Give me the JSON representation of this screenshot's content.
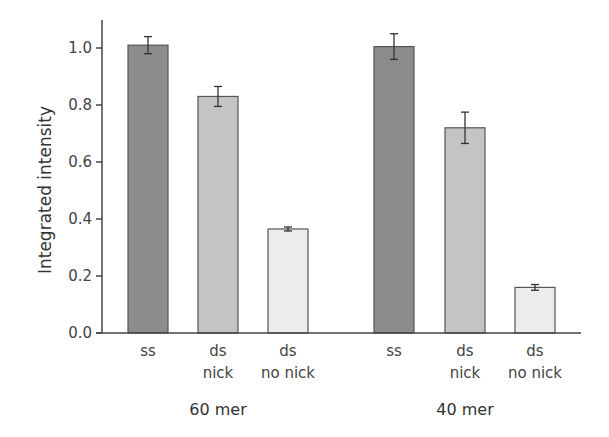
{
  "chart_data": {
    "type": "bar",
    "title": "",
    "xlabel": "",
    "ylabel": "Integrated intensity",
    "ylim": [
      0,
      1.1
    ],
    "yticks": [
      0.0,
      0.2,
      0.4,
      0.6,
      0.8,
      1.0
    ],
    "ytick_labels": [
      "0.0",
      "0.2",
      "0.4",
      "0.6",
      "0.8",
      "1.0"
    ],
    "grid": false,
    "legend": null,
    "groups": [
      {
        "label": "60 mer",
        "bars": [
          {
            "category": "ss",
            "category_lines": [
              "ss"
            ],
            "value": 1.01,
            "error": 0.03,
            "color": "#8c8c8c"
          },
          {
            "category": "ds nick",
            "category_lines": [
              "ds",
              "nick"
            ],
            "value": 0.83,
            "error": 0.035,
            "color": "#c4c4c4"
          },
          {
            "category": "ds no nick",
            "category_lines": [
              "ds",
              "no nick"
            ],
            "value": 0.365,
            "error": 0.007,
            "color": "#ececec"
          }
        ]
      },
      {
        "label": "40 mer",
        "bars": [
          {
            "category": "ss",
            "category_lines": [
              "ss"
            ],
            "value": 1.005,
            "error": 0.045,
            "color": "#8c8c8c"
          },
          {
            "category": "ds nick",
            "category_lines": [
              "ds",
              "nick"
            ],
            "value": 0.72,
            "error": 0.055,
            "color": "#c4c4c4"
          },
          {
            "category": "ds no nick",
            "category_lines": [
              "ds",
              "no nick"
            ],
            "value": 0.16,
            "error": 0.01,
            "color": "#ececec"
          }
        ]
      }
    ],
    "categories": [
      "ss",
      "ds nick",
      "ds no nick",
      "ss",
      "ds nick",
      "ds no nick"
    ],
    "values": [
      1.01,
      0.83,
      0.365,
      1.005,
      0.72,
      0.16
    ],
    "errors": [
      0.03,
      0.035,
      0.007,
      0.045,
      0.055,
      0.01
    ]
  }
}
